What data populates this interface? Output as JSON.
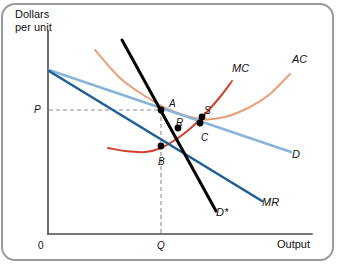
{
  "chart_data": {
    "type": "line",
    "title": "",
    "subtitle": "",
    "ylabel": "Dollars\nper unit",
    "ylabel_line1": "Dollars",
    "ylabel_line2": "per unit",
    "xlabel": "Output",
    "origin_label": "0",
    "grid": false,
    "legend_position": "inline-curve-labels",
    "axis_ticks": {
      "y": [
        {
          "label": "P",
          "value": "P"
        }
      ],
      "x": [
        {
          "label": "Q",
          "value": "Q"
        }
      ]
    },
    "series": [
      {
        "name": "AC",
        "label": "AC",
        "color": "#e8a078",
        "shape": "u-curve",
        "description": "Average cost curve, downward then upward sloping",
        "points": [
          [
            95,
            50
          ],
          [
            120,
            78
          ],
          [
            145,
            96
          ],
          [
            170,
            110
          ],
          [
            200,
            119
          ],
          [
            225,
            117
          ],
          [
            250,
            107
          ],
          [
            270,
            94
          ],
          [
            290,
            74
          ]
        ]
      },
      {
        "name": "MC",
        "label": "MC",
        "color": "#d0402a",
        "shape": "u-curve",
        "description": "Marginal cost curve, U shaped",
        "points": [
          [
            108,
            148
          ],
          [
            125,
            151
          ],
          [
            145,
            152
          ],
          [
            161,
            148
          ],
          [
            178,
            138
          ],
          [
            192,
            127
          ],
          [
            206,
            113
          ],
          [
            220,
            97
          ],
          [
            232,
            81
          ]
        ]
      },
      {
        "name": "D",
        "label": "D",
        "color": "#8ab4d8",
        "shape": "line",
        "description": "Firm demand curve, gently downward sloping",
        "points": [
          [
            49,
            70
          ],
          [
            291,
            152
          ]
        ]
      },
      {
        "name": "MR",
        "label": "MR",
        "color": "#1f5f96",
        "shape": "line",
        "description": "Marginal revenue curve, steeper downward sloping",
        "points": [
          [
            49,
            71
          ],
          [
            262,
            201
          ]
        ]
      },
      {
        "name": "D*",
        "label": "D*",
        "color": "#000000",
        "shape": "line",
        "description": "Steep perceived demand curve",
        "points": [
          [
            122,
            40
          ],
          [
            216,
            211
          ]
        ]
      }
    ],
    "dashed_guides": [
      {
        "name": "price-guide",
        "from": [
          49,
          110
        ],
        "to": [
          161,
          110
        ],
        "orientation": "horizontal"
      },
      {
        "name": "quantity-guide",
        "from": [
          161,
          110
        ],
        "to": [
          161,
          234
        ],
        "orientation": "vertical"
      }
    ],
    "marked_points": [
      {
        "label": "A",
        "x": 161,
        "y": 110,
        "label_dx": 8,
        "label_dy": -6
      },
      {
        "label": "B",
        "x": 161,
        "y": 146,
        "label_dx": -3,
        "label_dy": 16
      },
      {
        "label": "R",
        "x": 178,
        "y": 128,
        "label_dx": -2,
        "label_dy": -5
      },
      {
        "label": "S",
        "x": 202,
        "y": 117,
        "label_dx": 2,
        "label_dy": -6
      },
      {
        "label": "C",
        "x": 200,
        "y": 123,
        "label_dx": 1,
        "label_dy": 15
      }
    ],
    "axes": {
      "x_from": [
        48,
        234
      ],
      "x_to": [
        312,
        234
      ],
      "y_from": [
        48,
        234
      ],
      "y_to": [
        48,
        31
      ],
      "color": "#4a4a4a"
    },
    "colors": {
      "ac": "#e8a078",
      "mc": "#d0402a",
      "demand": "#8ab4d8",
      "marginal_revenue": "#1f5f96",
      "perceived_demand": "#000000",
      "axis": "#4a4a4a",
      "dashed": "#8d8d8d",
      "border": "#9a9a9a",
      "background": "#ffffff"
    }
  }
}
